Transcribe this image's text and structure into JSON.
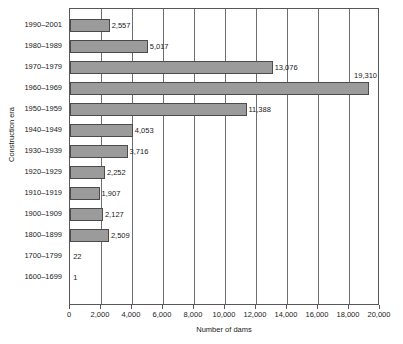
{
  "chart_data": {
    "type": "bar",
    "orientation": "horizontal",
    "title": "",
    "xlabel": "Number of dams",
    "ylabel": "Construction era",
    "xlim": [
      0,
      20000
    ],
    "ylim": null,
    "grid": true,
    "legend": null,
    "x_ticks": [
      0,
      2000,
      4000,
      6000,
      8000,
      10000,
      12000,
      14000,
      16000,
      18000,
      20000
    ],
    "x_tick_labels": [
      "0",
      "2,000",
      "4,000",
      "6,000",
      "8,000",
      "10,000",
      "12,000",
      "14,000",
      "16,000",
      "18,000",
      "20,000"
    ],
    "categories": [
      "1990–2001",
      "1980–1989",
      "1970–1979",
      "1960–1969",
      "1950–1959",
      "1940–1949",
      "1930–1939",
      "1920–1929",
      "1910–1919",
      "1900–1909",
      "1800–1899",
      "1700–1799",
      "1600–1699"
    ],
    "values": [
      2557,
      5017,
      13076,
      19310,
      11388,
      4053,
      3716,
      2252,
      1907,
      2127,
      2509,
      22,
      1
    ],
    "value_labels": [
      "2,557",
      "5,017",
      "13,076",
      "19,310",
      "11,388",
      "4,053",
      "3,716",
      "2,252",
      "1,907",
      "2,127",
      "2,509",
      "22",
      "1"
    ],
    "label_positions": [
      "right",
      "right",
      "right",
      "above",
      "right",
      "right",
      "right",
      "right",
      "right",
      "right",
      "right",
      "right",
      "right"
    ],
    "bar_color": "#9b9b9b",
    "bar_edge_color": "#4b4b4d",
    "grid_color": "#6e6e70",
    "axis_color": "#58585a",
    "background_color": "#ffffff"
  }
}
